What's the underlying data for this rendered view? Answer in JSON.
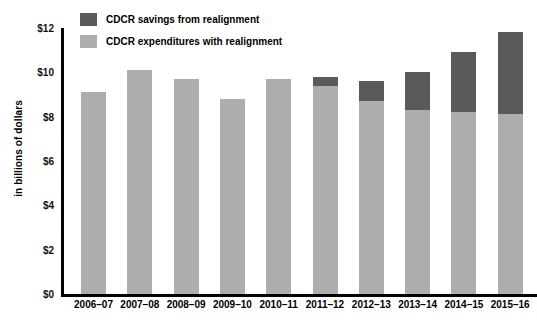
{
  "chart_data": {
    "type": "bar",
    "stacked": true,
    "title": "",
    "xlabel": "",
    "ylabel": "in billions of dollars",
    "ylim": [
      0,
      12
    ],
    "ytick_format": "$",
    "yticks": [
      "$0",
      "$2",
      "$4",
      "$6",
      "$8",
      "$10",
      "$12"
    ],
    "ytick_values": [
      0,
      2,
      4,
      6,
      8,
      10,
      12
    ],
    "grid": false,
    "legend_position": "top-left",
    "categories": [
      "2006–07",
      "2007–08",
      "2008–09",
      "2009–10",
      "2010–11",
      "2011–12",
      "2012–13",
      "2013–14",
      "2014–15",
      "2015–16"
    ],
    "series": [
      {
        "name": "CDCR expenditures with realignment",
        "color": "#adadad",
        "values": [
          9.1,
          10.1,
          9.7,
          8.8,
          9.7,
          9.4,
          8.7,
          8.3,
          8.2,
          8.1
        ]
      },
      {
        "name": "CDCR savings from realignment",
        "color": "#5a5a5a",
        "values": [
          0,
          0,
          0,
          0,
          0,
          0.4,
          0.9,
          1.7,
          2.7,
          3.7
        ]
      }
    ],
    "totals": [
      9.1,
      10.1,
      9.7,
      8.8,
      9.7,
      9.8,
      9.6,
      10.0,
      10.9,
      11.8
    ]
  },
  "legend": {
    "items": [
      {
        "label": "CDCR savings from realignment",
        "color": "#5a5a5a"
      },
      {
        "label": "CDCR expenditures with realignment",
        "color": "#adadad"
      }
    ]
  },
  "axes": {
    "y_title": "in billions of dollars"
  }
}
